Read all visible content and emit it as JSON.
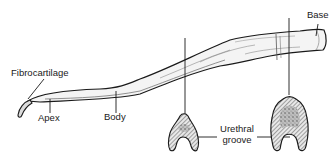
{
  "diagram": {
    "labels": {
      "fibrocartilage": "Fibrocartilage",
      "apex": "Apex",
      "body": "Body",
      "base": "Base",
      "urethral_groove_line1": "Urethral",
      "urethral_groove_line2": "groove"
    },
    "cross_sections": [
      {
        "position": "distal",
        "shape": "small U-shaped section"
      },
      {
        "position": "proximal",
        "shape": "large U-shaped section"
      }
    ],
    "colors": {
      "outline": "#1a1a1a",
      "bone_fill": "#f4f4f4",
      "hatch": "#555555",
      "background": "#ffffff"
    }
  }
}
